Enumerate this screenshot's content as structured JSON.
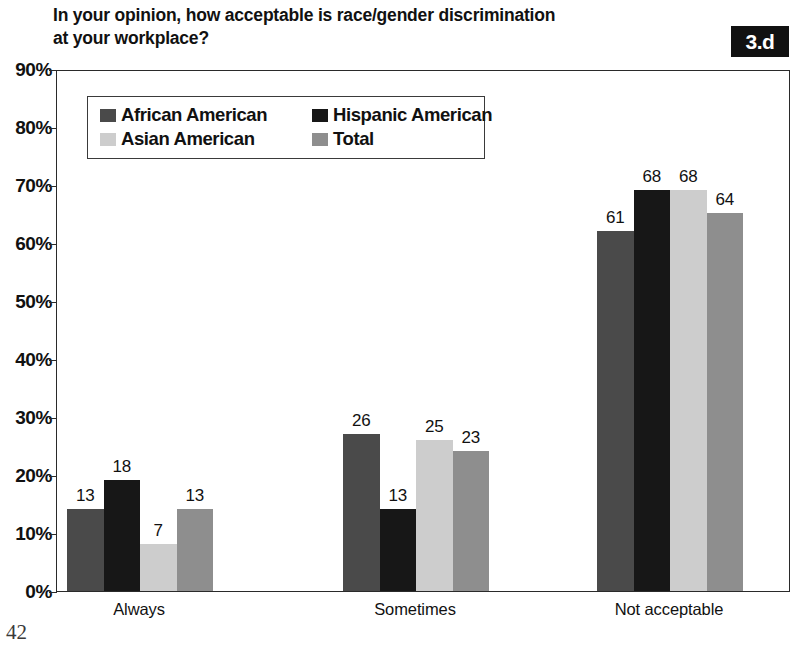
{
  "title": "In your opinion, how acceptable is race/gender discrimination\nat your workplace?",
  "badge": "3.d",
  "page_number": "42",
  "chart_data": {
    "type": "bar",
    "title": "In your opinion, how acceptable is race/gender discrimination at your workplace?",
    "xlabel": "",
    "ylabel": "",
    "ylim": [
      0,
      90
    ],
    "ytick_labels": [
      "0%",
      "10%",
      "20%",
      "30%",
      "40%",
      "50%",
      "60%",
      "70%",
      "80%",
      "90%"
    ],
    "ytick_values": [
      0,
      10,
      20,
      30,
      40,
      50,
      60,
      70,
      80,
      90
    ],
    "grid": false,
    "legend_position": "upper-left-inside",
    "categories": [
      "Always",
      "Sometimes",
      "Not acceptable"
    ],
    "series": [
      {
        "name": "African American",
        "color": "#4a4a4a",
        "values": [
          13,
          26,
          61
        ]
      },
      {
        "name": "Hispanic American",
        "color": "#171717",
        "values": [
          18,
          13,
          68
        ]
      },
      {
        "name": "Asian American",
        "color": "#cdcdcd",
        "values": [
          7,
          25,
          68
        ]
      },
      {
        "name": "Total",
        "color": "#8e8e8e",
        "values": [
          13,
          23,
          64
        ]
      }
    ]
  }
}
